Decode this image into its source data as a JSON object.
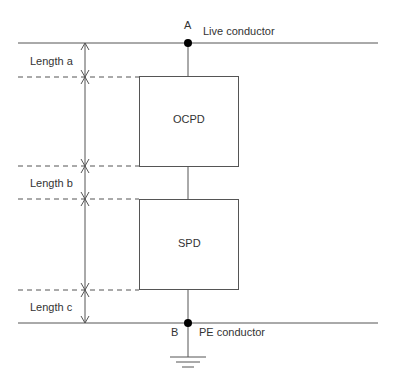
{
  "diagram": {
    "nodes": {
      "a_label": "A",
      "b_label": "B"
    },
    "conductors": {
      "live": "Live conductor",
      "pe": "PE conductor"
    },
    "devices": {
      "ocpd": "OCPD",
      "spd": "SPD"
    },
    "lengths": {
      "a": "Length a",
      "b": "Length b",
      "c": "Length c"
    },
    "colors": {
      "line": "#555555",
      "text": "#333333",
      "dot": "#000000"
    }
  }
}
